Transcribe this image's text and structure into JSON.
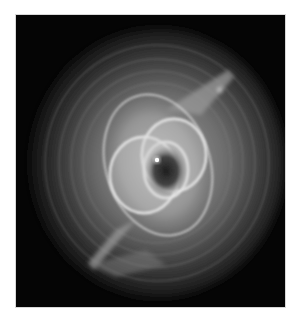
{
  "image": {
    "subject": "Cat's Eye Nebula",
    "style": "grayscale astronomical photograph",
    "background_color": "#ffffff",
    "frame_color": "#050505",
    "colors": {
      "halo": "#4a4a4a",
      "outer_shell": "#8a8a8a",
      "inner_shell": "#d0d0d0",
      "core": "#2a2a2a",
      "star": "#ffffff"
    }
  }
}
